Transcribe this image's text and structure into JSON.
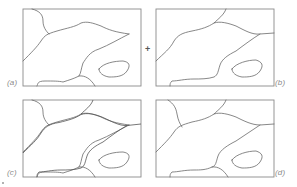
{
  "figure": {
    "panels": [
      {
        "id": "a",
        "label": "(a)",
        "description": "grain boundary contour map A"
      },
      {
        "id": "b",
        "label": "(b)",
        "description": "grain boundary contour map B"
      },
      {
        "id": "c",
        "label": "(c)",
        "description": "overlay of A and B"
      },
      {
        "id": "d",
        "label": "(d)",
        "description": "merged result"
      }
    ],
    "operator": "+",
    "colors": {
      "line": "#6a6a6a",
      "frame": "#8a8a8a",
      "label": "#8a8a8a",
      "background": "#ffffff"
    }
  }
}
